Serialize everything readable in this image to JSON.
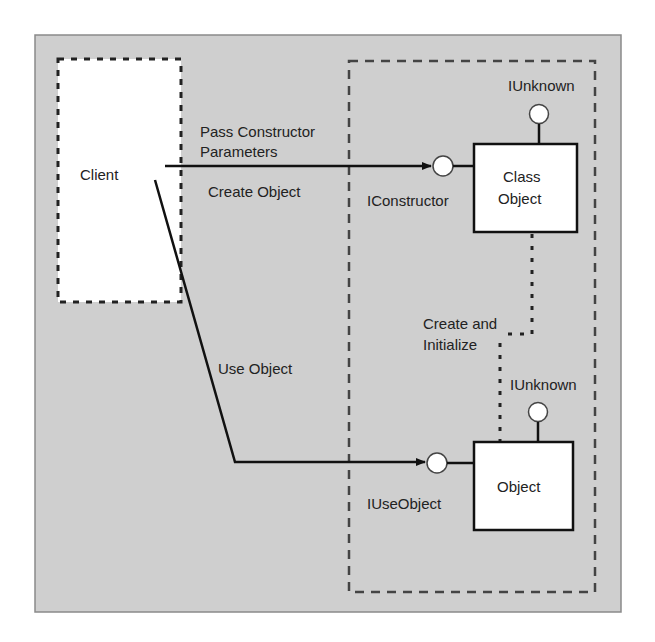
{
  "diagram": {
    "colors": {
      "background": "#cfcfcf",
      "frame_border": "#8a8a8a",
      "box_fill": "#ffffff",
      "line": "#111111",
      "dashed": "#444444"
    },
    "client": {
      "label": "Client"
    },
    "arrows": {
      "top_label_line1": "Pass Constructor",
      "top_label_line2": "Parameters",
      "create_object": "Create Object",
      "use_object": "Use Object"
    },
    "class_object": {
      "label_line1": "Class",
      "label_line2": "Object",
      "interface_left": "IConstructor",
      "interface_top": "IUnknown"
    },
    "create_and_initialize": {
      "line1": "Create and",
      "line2": "Initialize"
    },
    "object": {
      "label": "Object",
      "interface_left": "IUseObject",
      "interface_top": "IUnknown"
    }
  }
}
